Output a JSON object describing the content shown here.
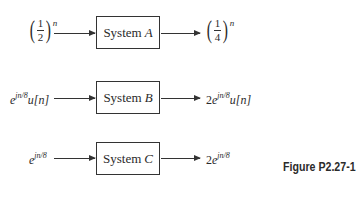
{
  "diagram": {
    "systems": [
      {
        "id": "A",
        "label": "System",
        "letter": "A",
        "input": {
          "base_num": "1",
          "base_den": "2",
          "exponent": "n",
          "text": "(1/2)^n"
        },
        "output": {
          "base_num": "1",
          "base_den": "4",
          "exponent": "n",
          "text": "(1/4)^n"
        }
      },
      {
        "id": "B",
        "label": "System",
        "letter": "B",
        "input": {
          "coef": "",
          "base": "e",
          "exponent": "jn/8",
          "suffix": "u[n]",
          "text": "e^{jn/8}u[n]"
        },
        "output": {
          "coef": "2",
          "base": "e",
          "exponent": "jn/8",
          "suffix": "u[n]",
          "text": "2e^{jn/8}u[n]"
        }
      },
      {
        "id": "C",
        "label": "System",
        "letter": "C",
        "input": {
          "coef": "",
          "base": "e",
          "exponent": "jn/8",
          "suffix": "",
          "text": "e^{jn/8}"
        },
        "output": {
          "coef": "2",
          "base": "e",
          "exponent": "jn/8",
          "suffix": "",
          "text": "2e^{jn/8}"
        }
      }
    ],
    "caption": "Figure P2.27-1"
  }
}
